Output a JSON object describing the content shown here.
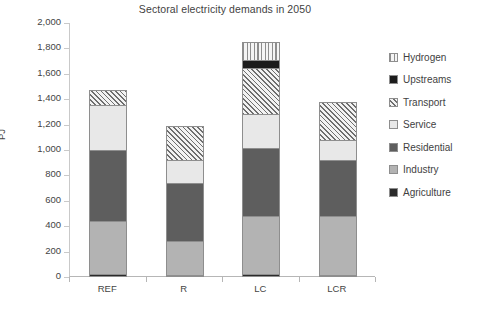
{
  "chart_data": {
    "type": "bar",
    "subtype": "stacked-bar",
    "title": "Sectoral electricity demands in 2050",
    "xlabel": "",
    "ylabel": "PJ",
    "ylim": [
      0,
      2000
    ],
    "ytick_step": 200,
    "grid": false,
    "legend_position": "right",
    "categories": [
      "REF",
      "R",
      "LC",
      "LCR"
    ],
    "ytick_labels": [
      "2,000",
      "1,800",
      "1,600",
      "1,400",
      "1,200",
      "1,000",
      "800",
      "600",
      "400",
      "200",
      "0"
    ],
    "ytick_values": [
      2000,
      1800,
      1600,
      1400,
      1200,
      1000,
      800,
      600,
      400,
      200,
      0
    ],
    "series": [
      {
        "name": "Agriculture",
        "pattern": "solid-black",
        "color": "#2b2b2b",
        "values": [
          20,
          18,
          20,
          18
        ]
      },
      {
        "name": "Industry",
        "pattern": "solid-light-gray",
        "color": "#b3b3b3",
        "values": [
          420,
          265,
          460,
          460
        ]
      },
      {
        "name": "Residential",
        "pattern": "solid-dark-gray",
        "color": "#5e5e5e",
        "values": [
          560,
          455,
          535,
          440
        ]
      },
      {
        "name": "Service",
        "pattern": "solid-very-light",
        "color": "#e8e8e8",
        "values": [
          355,
          185,
          270,
          160
        ]
      },
      {
        "name": "Transport",
        "pattern": "diagonal-hatch",
        "color": "#f2f2f2",
        "values": [
          120,
          270,
          360,
          300
        ]
      },
      {
        "name": "Upstreams",
        "pattern": "solid-black",
        "color": "#1c1c1c",
        "values": [
          0,
          0,
          60,
          0
        ]
      },
      {
        "name": "Hydrogen",
        "pattern": "vertical-stripes",
        "color": "#f4f4f4",
        "values": [
          0,
          0,
          145,
          0
        ]
      }
    ],
    "totals": [
      1475,
      1193,
      1850,
      1378
    ]
  },
  "legend": {
    "items": [
      {
        "label": "Hydrogen"
      },
      {
        "label": "Upstreams"
      },
      {
        "label": "Transport"
      },
      {
        "label": "Service"
      },
      {
        "label": "Residential"
      },
      {
        "label": "Industry"
      },
      {
        "label": "Agriculture"
      }
    ]
  }
}
